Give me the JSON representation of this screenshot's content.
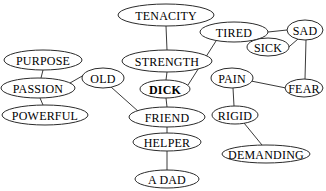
{
  "diagram": {
    "background_color": "#ffffff",
    "node_fill_color": "#ffffff",
    "node_stroke_color": "#2b2b2b",
    "edge_stroke_color": "#3a3a3a",
    "label_color": "#000000",
    "nodes": [
      {
        "id": "tenacity",
        "label": "TENACITY",
        "cx": 166,
        "cy": 15,
        "rx": 48,
        "ry": 11,
        "font_size": 12,
        "bold": false
      },
      {
        "id": "tired",
        "label": "TIRED",
        "cx": 234,
        "cy": 32,
        "rx": 34,
        "ry": 10,
        "font_size": 12,
        "bold": false
      },
      {
        "id": "sad",
        "label": "SAD",
        "cx": 305,
        "cy": 30,
        "rx": 18,
        "ry": 10,
        "font_size": 12,
        "bold": false
      },
      {
        "id": "sick",
        "label": "SICK",
        "cx": 268,
        "cy": 47,
        "rx": 21,
        "ry": 9,
        "font_size": 12,
        "bold": false
      },
      {
        "id": "strength",
        "label": "STRENGTH",
        "cx": 167,
        "cy": 61,
        "rx": 45,
        "ry": 11,
        "font_size": 12,
        "bold": false
      },
      {
        "id": "purpose",
        "label": "PURPOSE",
        "cx": 43,
        "cy": 60,
        "rx": 39,
        "ry": 10,
        "font_size": 12,
        "bold": false
      },
      {
        "id": "passion",
        "label": "PASSION",
        "cx": 38,
        "cy": 88,
        "rx": 37,
        "ry": 10,
        "font_size": 12,
        "bold": false
      },
      {
        "id": "old",
        "label": "OLD",
        "cx": 103,
        "cy": 78,
        "rx": 21,
        "ry": 10,
        "font_size": 12,
        "bold": false
      },
      {
        "id": "pain",
        "label": "PAIN",
        "cx": 232,
        "cy": 78,
        "rx": 21,
        "ry": 10,
        "font_size": 12,
        "bold": false
      },
      {
        "id": "fear",
        "label": "FEAR",
        "cx": 304,
        "cy": 88,
        "rx": 19,
        "ry": 9,
        "font_size": 12,
        "bold": false
      },
      {
        "id": "dick",
        "label": "DICK",
        "cx": 165,
        "cy": 89,
        "rx": 25,
        "ry": 9,
        "font_size": 12,
        "bold": true
      },
      {
        "id": "powerful",
        "label": "POWERFUL",
        "cx": 45,
        "cy": 115,
        "rx": 43,
        "ry": 10,
        "font_size": 12,
        "bold": false
      },
      {
        "id": "friend",
        "label": "FRIEND",
        "cx": 167,
        "cy": 117,
        "rx": 38,
        "ry": 10,
        "font_size": 12,
        "bold": false
      },
      {
        "id": "rigid",
        "label": "RIGID",
        "cx": 235,
        "cy": 115,
        "rx": 23,
        "ry": 9,
        "font_size": 12,
        "bold": false
      },
      {
        "id": "helper",
        "label": "HELPER",
        "cx": 167,
        "cy": 142,
        "rx": 34,
        "ry": 9,
        "font_size": 12,
        "bold": false
      },
      {
        "id": "demanding",
        "label": "DEMANDING",
        "cx": 266,
        "cy": 154,
        "rx": 44,
        "ry": 9,
        "font_size": 12,
        "bold": false
      },
      {
        "id": "a-dad",
        "label": "A DAD",
        "cx": 167,
        "cy": 179,
        "rx": 32,
        "ry": 9,
        "font_size": 12,
        "bold": false
      }
    ],
    "edges": [
      {
        "from": "tenacity",
        "to": "strength",
        "x1": 166,
        "y1": 26,
        "x2": 167,
        "y2": 50
      },
      {
        "from": "tired",
        "to": "sad",
        "x1": 268,
        "y1": 32,
        "x2": 287,
        "y2": 30
      },
      {
        "from": "tired",
        "to": "dick",
        "x1": 216,
        "y1": 41,
        "x2": 188,
        "y2": 85
      },
      {
        "from": "sad",
        "to": "sick",
        "x1": 298,
        "y1": 39,
        "x2": 283,
        "y2": 52
      },
      {
        "from": "sad",
        "to": "fear",
        "x1": 306,
        "y1": 40,
        "x2": 305,
        "y2": 79
      },
      {
        "from": "pain",
        "to": "fear",
        "x1": 251,
        "y1": 81,
        "x2": 286,
        "y2": 88
      },
      {
        "from": "pain",
        "to": "rigid",
        "x1": 233,
        "y1": 88,
        "x2": 234,
        "y2": 106
      },
      {
        "from": "rigid",
        "to": "demanding",
        "x1": 244,
        "y1": 123,
        "x2": 262,
        "y2": 145
      },
      {
        "from": "purpose",
        "to": "passion",
        "x1": 43,
        "y1": 70,
        "x2": 41,
        "y2": 78
      },
      {
        "from": "passion",
        "to": "old",
        "x1": 70,
        "y1": 83,
        "x2": 84,
        "y2": 75
      },
      {
        "from": "passion",
        "to": "powerful",
        "x1": 40,
        "y1": 98,
        "x2": 43,
        "y2": 105
      },
      {
        "from": "old",
        "to": "friend",
        "x1": 111,
        "y1": 87,
        "x2": 139,
        "y2": 112
      },
      {
        "from": "strength",
        "to": "dick",
        "x1": 167,
        "y1": 72,
        "x2": 166,
        "y2": 80
      },
      {
        "from": "dick",
        "to": "friend",
        "x1": 166,
        "y1": 98,
        "x2": 167,
        "y2": 107
      },
      {
        "from": "friend",
        "to": "helper",
        "x1": 167,
        "y1": 127,
        "x2": 167,
        "y2": 133
      },
      {
        "from": "helper",
        "to": "a-dad",
        "x1": 167,
        "y1": 151,
        "x2": 167,
        "y2": 170
      }
    ]
  }
}
